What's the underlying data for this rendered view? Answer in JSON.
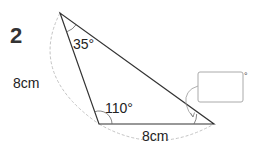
{
  "problem": {
    "number": "2",
    "side_left": "8cm",
    "side_bottom": "8cm",
    "angle_top": "35°",
    "angle_bottom_left": "110°",
    "answer_box_value": "",
    "answer_unit": "°"
  },
  "geometry": {
    "vertices": {
      "top": [
        60,
        13
      ],
      "bottom_left": [
        99,
        124
      ],
      "right": [
        214,
        124
      ]
    },
    "line_color": "#333333",
    "dashed_arc_color": "#bbbbbb",
    "box_border_color": "#aaaaaa"
  }
}
